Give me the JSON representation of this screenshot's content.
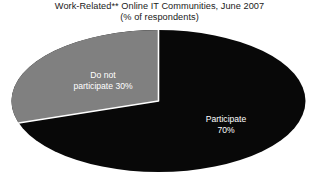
{
  "chart_data": {
    "type": "pie",
    "title": "Work-Related** Online IT Communities, June 2007",
    "subtitle": "(% of respondents)",
    "xlabel": "",
    "ylabel": "",
    "units": "% of respondents",
    "legend_position": "none",
    "grid": false,
    "categories": [
      "Participate",
      "Do not participate"
    ],
    "values": [
      70,
      30
    ],
    "slices": [
      {
        "name": "participate",
        "label_line1": "Participate",
        "label_line2": "70%",
        "value": 70,
        "color": "#080808",
        "label_color": "#ffffff"
      },
      {
        "name": "do-not-participate",
        "label_line1": "Do not",
        "label_line2": "participate 30%",
        "value": 30,
        "color": "#808080",
        "label_color": "#ffffff"
      }
    ],
    "background_color": "#ffffff",
    "separator_color": "#ffffff"
  },
  "labels": {
    "do_not_participate_line1": "Do not",
    "do_not_participate_line2": "participate 30%",
    "participate_line1": "Participate",
    "participate_line2": "70%"
  }
}
